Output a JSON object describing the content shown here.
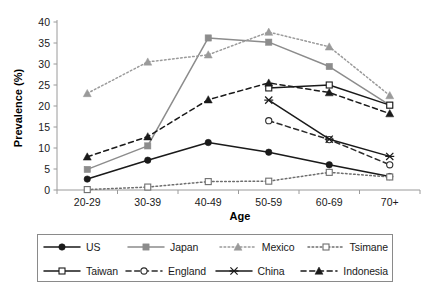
{
  "chart_data": {
    "type": "line",
    "title": "",
    "xlabel": "Age",
    "ylabel": "Prevalence (%)",
    "categories": [
      "20-29",
      "30-39",
      "40-49",
      "50-59",
      "60-69",
      "70+"
    ],
    "ylim": [
      0,
      40
    ],
    "yticks": [
      0,
      5,
      10,
      15,
      20,
      25,
      30,
      35,
      40
    ],
    "ytick_labels": [
      "0",
      "5",
      "10",
      "15",
      "20",
      "25",
      "30",
      "35",
      "40"
    ],
    "grid": false,
    "legend_position": "bottom",
    "series": [
      {
        "name": "US",
        "values": [
          2.6,
          7.1,
          11.3,
          9.0,
          6.0,
          3.2
        ],
        "color": "#1a1a1a",
        "line_style": "solid",
        "marker": "filled-circle"
      },
      {
        "name": "Japan",
        "values": [
          4.9,
          10.5,
          36.2,
          35.2,
          29.4,
          20.2
        ],
        "color": "#8c8c8c",
        "line_style": "solid",
        "marker": "filled-square"
      },
      {
        "name": "Mexico",
        "values": [
          23.0,
          30.5,
          32.2,
          37.6,
          34.1,
          22.5
        ],
        "color": "#9a9a9a",
        "line_style": "dotted",
        "marker": "filled-triangle"
      },
      {
        "name": "Tsimane",
        "values": [
          0.1,
          0.7,
          2.0,
          2.1,
          4.2,
          3.1
        ],
        "color": "#6e6e6e",
        "line_style": "dotted",
        "marker": "open-square"
      },
      {
        "name": "Taiwan",
        "values": [
          null,
          null,
          null,
          24.3,
          25.0,
          20.2
        ],
        "color": "#1a1a1a",
        "line_style": "solid",
        "marker": "open-square"
      },
      {
        "name": "England",
        "values": [
          null,
          null,
          null,
          16.5,
          12.0,
          6.0
        ],
        "color": "#2b2b2b",
        "line_style": "dashed",
        "marker": "open-circle"
      },
      {
        "name": "China",
        "values": [
          null,
          null,
          null,
          21.4,
          12.1,
          8.0
        ],
        "color": "#1a1a1a",
        "line_style": "solid",
        "marker": "asterisk"
      },
      {
        "name": "Indonesia",
        "values": [
          7.9,
          12.7,
          21.5,
          25.5,
          23.2,
          18.2
        ],
        "color": "#1a1a1a",
        "line_style": "dashed",
        "marker": "filled-triangle"
      }
    ]
  },
  "axes": {
    "y_title": "Prevalence (%)",
    "x_title": "Age"
  },
  "legend": {
    "rows": [
      [
        {
          "label": "US",
          "key": "us"
        },
        {
          "label": "Japan",
          "key": "japan"
        },
        {
          "label": "Mexico",
          "key": "mexico"
        },
        {
          "label": "Tsimane",
          "key": "tsimane"
        }
      ],
      [
        {
          "label": "Taiwan",
          "key": "taiwan"
        },
        {
          "label": "England",
          "key": "england"
        },
        {
          "label": "China",
          "key": "china"
        },
        {
          "label": "Indonesia",
          "key": "indonesia"
        }
      ]
    ]
  }
}
